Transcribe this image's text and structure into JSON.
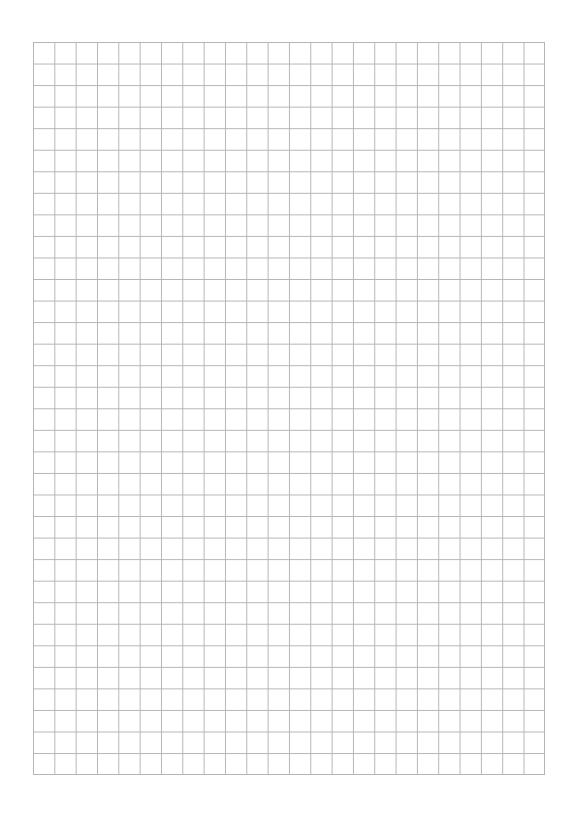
{
  "page": {
    "width": 573,
    "height": 816,
    "background_color": "#ffffff"
  },
  "grid": {
    "name": "graph-paper-grid",
    "origin_x": 33,
    "origin_y": 42,
    "width": 512,
    "height": 733,
    "columns": 24,
    "rows": 34,
    "cell_width": 21.33,
    "cell_height": 21.56,
    "line_color": "#b5b5b8",
    "line_width_px": 1,
    "minor_lines": true,
    "major_lines": false,
    "fill_color": "#ffffff"
  },
  "margins": {
    "top": 42,
    "left": 33,
    "right": 28,
    "bottom": 41,
    "color": "#ffffff"
  },
  "content": {
    "text_items": [],
    "annotations": [],
    "note": ""
  }
}
